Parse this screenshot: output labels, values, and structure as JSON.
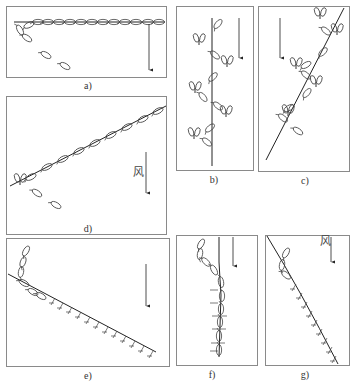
{
  "figure": {
    "panels": [
      {
        "id": "a",
        "label": "a)",
        "wind_label": ""
      },
      {
        "id": "b",
        "label": "b)",
        "wind_label": ""
      },
      {
        "id": "c",
        "label": "c)",
        "wind_label": ""
      },
      {
        "id": "d",
        "label": "d)",
        "wind_label": "风"
      },
      {
        "id": "e",
        "label": "e)",
        "wind_label": ""
      },
      {
        "id": "f",
        "label": "f)",
        "wind_label": ""
      },
      {
        "id": "g",
        "label": "g)",
        "wind_label": "风"
      }
    ],
    "colors": {
      "line": "#222222",
      "frame": "#8a8a8a",
      "glyph": "#444444"
    }
  }
}
